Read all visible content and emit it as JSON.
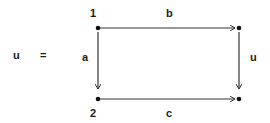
{
  "equation": {
    "lhs": "u",
    "equals": "="
  },
  "nodes": [
    {
      "id": "n1",
      "label": "1"
    },
    {
      "id": "n2",
      "label": "2"
    },
    {
      "id": "n3",
      "label": ""
    },
    {
      "id": "n4",
      "label": ""
    }
  ],
  "edges": [
    {
      "from": "n1",
      "to": "n3",
      "label": "b"
    },
    {
      "from": "n1",
      "to": "n2",
      "label": "a"
    },
    {
      "from": "n3",
      "to": "n4",
      "label": "u"
    },
    {
      "from": "n2",
      "to": "n4",
      "label": "c"
    }
  ],
  "colors": {
    "stroke": "#333333",
    "node": "#111111",
    "text": "#1a1a1a"
  }
}
